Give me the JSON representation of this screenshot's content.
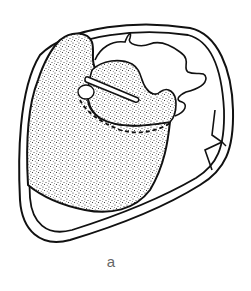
{
  "figure": {
    "panel_label": "a",
    "style": {
      "stroke_color": "#111111",
      "stipple_color": "#222222",
      "background": "#ffffff",
      "label_color": "#666666"
    },
    "elements": [
      {
        "name": "outer-wall",
        "description": "outer rounded boundary (double contour)"
      },
      {
        "name": "stippled-mass-large",
        "description": "large stippled region on the left"
      },
      {
        "name": "stippled-mass-upper",
        "description": "smaller stippled lobe in the upper center"
      },
      {
        "name": "wavy-outline",
        "description": "unshaded convoluted outline at top right"
      },
      {
        "name": "bar-structure",
        "description": "diagonal elongated bar across upper lobe"
      },
      {
        "name": "small-oval",
        "description": "small white oval at left end of bar"
      },
      {
        "name": "dashed-boundary",
        "description": "dashed curved boundary line within stippled mass"
      },
      {
        "name": "right-notch",
        "description": "angular notch on the right wall"
      }
    ]
  }
}
